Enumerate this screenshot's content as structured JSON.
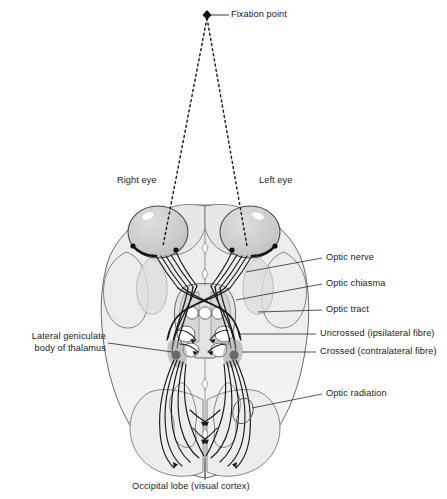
{
  "figure": {
    "type": "anatomical-diagram",
    "view": "inferior (ventral) view of the human brain",
    "background_color": "#ffffff",
    "line_color": "#1a1a1a",
    "brain_fill_light": "#f2f2f2",
    "brain_fill_mid": "#e0e0e0",
    "brain_fill_dark": "#c9c9c9",
    "eye_fill": "#cfcfcf"
  },
  "labels": {
    "fixation_point": "Fixation point",
    "right_eye": "Right eye",
    "left_eye": "Left eye",
    "optic_nerve": "Optic nerve",
    "optic_chiasma": "Optic chiasma",
    "optic_tract": "Optic tract",
    "uncrossed_fibre": "Uncrossed (ipsilateral fibre)",
    "crossed_fibre": "Crossed (contralateral fibre)",
    "lgn_line1": "Lateral geniculate",
    "lgn_line2": "body of thalamus",
    "optic_radiation": "Optic radiation",
    "occipital_lobe": "Occipital lobe (visual cortex)"
  },
  "structures": [
    {
      "name": "fixation-point",
      "kind": "marker",
      "x": 207,
      "y": 15
    },
    {
      "name": "right-eye",
      "kind": "eyeball",
      "cx": 158,
      "cy": 232
    },
    {
      "name": "left-eye",
      "kind": "eyeball",
      "cx": 250,
      "cy": 232
    },
    {
      "name": "optic-nerve-right",
      "kind": "fibre-bundle",
      "fibres": 5
    },
    {
      "name": "optic-nerve-left",
      "kind": "fibre-bundle",
      "fibres": 5
    },
    {
      "name": "optic-chiasma",
      "kind": "decussation",
      "cx": 204,
      "cy": 300
    },
    {
      "name": "optic-tract-right",
      "kind": "fibre-bundle"
    },
    {
      "name": "optic-tract-left",
      "kind": "fibre-bundle"
    },
    {
      "name": "lateral-geniculate-body-right",
      "kind": "nucleus",
      "cx": 182,
      "cy": 344
    },
    {
      "name": "lateral-geniculate-body-left",
      "kind": "nucleus",
      "cx": 228,
      "cy": 344
    },
    {
      "name": "colliculi",
      "kind": "circles",
      "count": 3,
      "cy": 313
    },
    {
      "name": "optic-radiation-right",
      "kind": "fibre-fan"
    },
    {
      "name": "optic-radiation-left",
      "kind": "fibre-fan"
    },
    {
      "name": "occipital-lobe",
      "kind": "cortex",
      "cx": 205,
      "cy": 462
    }
  ],
  "sight_lines": {
    "style": "dashed",
    "from": "fixation point",
    "to": [
      "right eye",
      "left eye"
    ]
  }
}
